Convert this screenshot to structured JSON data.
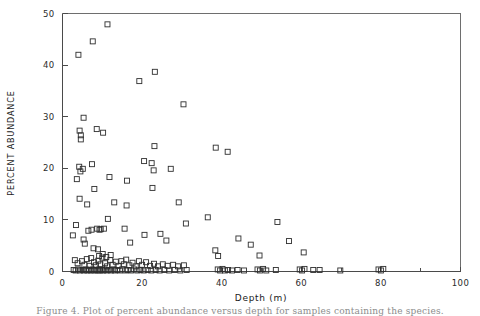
{
  "figure": {
    "caption": "Figure 4. Plot of percent abundance versus depth for samples containing the species."
  },
  "chart_data": {
    "type": "scatter",
    "title": "",
    "subtitle": "",
    "xlabel": "Depth (m)",
    "ylabel": "PERCENT ABUNDANCE",
    "xlim": [
      0,
      100
    ],
    "ylim": [
      0,
      50
    ],
    "xticks": [
      0,
      20,
      40,
      60,
      80,
      100
    ],
    "xtick_labels": [
      "0",
      "20",
      "40",
      "60",
      "80",
      "100"
    ],
    "xminor_ticks": [
      10,
      30,
      50,
      70,
      90
    ],
    "yticks": [
      0,
      10,
      20,
      30,
      40,
      50
    ],
    "ytick_labels": [
      "0",
      "10",
      "20",
      "30",
      "40",
      "50"
    ],
    "grid": false,
    "legend": null,
    "legend_position": "none",
    "marker": "open-square",
    "marker_color": "#2e2e2e",
    "marker_size": 5,
    "frame": "box",
    "series": [
      {
        "name": "percent abundance",
        "points": [
          [
            4.0,
            42.0
          ],
          [
            7.6,
            44.6
          ],
          [
            11.3,
            47.9
          ],
          [
            19.3,
            36.9
          ],
          [
            23.2,
            38.7
          ],
          [
            30.4,
            32.4
          ],
          [
            20.5,
            21.4
          ],
          [
            23.1,
            24.3
          ],
          [
            22.4,
            21.0
          ],
          [
            5.3,
            29.8
          ],
          [
            4.3,
            27.3
          ],
          [
            4.6,
            26.4
          ],
          [
            4.6,
            25.6
          ],
          [
            8.6,
            27.6
          ],
          [
            10.2,
            26.9
          ],
          [
            4.2,
            20.3
          ],
          [
            4.5,
            19.4
          ],
          [
            5.1,
            19.9
          ],
          [
            3.6,
            17.9
          ],
          [
            7.4,
            20.8
          ],
          [
            11.8,
            18.3
          ],
          [
            16.2,
            17.6
          ],
          [
            22.9,
            19.6
          ],
          [
            27.2,
            19.9
          ],
          [
            22.6,
            16.2
          ],
          [
            4.3,
            14.1
          ],
          [
            6.2,
            13.0
          ],
          [
            8.0,
            16.0
          ],
          [
            13.0,
            13.4
          ],
          [
            16.1,
            12.8
          ],
          [
            29.2,
            13.4
          ],
          [
            38.5,
            24.0
          ],
          [
            41.5,
            23.2
          ],
          [
            2.6,
            7.0
          ],
          [
            3.4,
            9.0
          ],
          [
            5.3,
            6.2
          ],
          [
            5.6,
            5.4
          ],
          [
            6.5,
            7.9
          ],
          [
            7.3,
            8.1
          ],
          [
            8.7,
            8.3
          ],
          [
            9.3,
            8.1
          ],
          [
            9.6,
            8.2
          ],
          [
            10.4,
            8.3
          ],
          [
            11.4,
            10.2
          ],
          [
            7.8,
            4.5
          ],
          [
            8.9,
            4.3
          ],
          [
            9.2,
            3.0
          ],
          [
            10.1,
            3.4
          ],
          [
            11.0,
            2.8
          ],
          [
            12.1,
            3.2
          ],
          [
            15.6,
            8.3
          ],
          [
            17.0,
            5.6
          ],
          [
            20.6,
            7.1
          ],
          [
            24.6,
            7.3
          ],
          [
            26.1,
            6.0
          ],
          [
            31.0,
            9.3
          ],
          [
            36.5,
            10.5
          ],
          [
            38.4,
            4.1
          ],
          [
            39.1,
            3.0
          ],
          [
            44.2,
            6.4
          ],
          [
            47.3,
            5.2
          ],
          [
            49.5,
            3.1
          ],
          [
            54.0,
            9.6
          ],
          [
            56.9,
            5.9
          ],
          [
            60.6,
            3.7
          ],
          [
            3.1,
            2.2
          ],
          [
            3.8,
            1.6
          ],
          [
            4.9,
            2.0
          ],
          [
            5.5,
            1.3
          ],
          [
            6.1,
            2.4
          ],
          [
            6.8,
            1.1
          ],
          [
            7.2,
            2.6
          ],
          [
            7.9,
            1.8
          ],
          [
            8.4,
            1.2
          ],
          [
            9.0,
            2.1
          ],
          [
            9.5,
            1.4
          ],
          [
            10.0,
            2.7
          ],
          [
            10.7,
            1.6
          ],
          [
            11.2,
            1.0
          ],
          [
            12.0,
            2.2
          ],
          [
            12.6,
            1.3
          ],
          [
            13.4,
            1.9
          ],
          [
            14.1,
            1.1
          ],
          [
            14.8,
            2.0
          ],
          [
            15.4,
            1.4
          ],
          [
            16.0,
            2.3
          ],
          [
            16.8,
            1.2
          ],
          [
            17.6,
            1.7
          ],
          [
            18.4,
            1.0
          ],
          [
            19.2,
            2.0
          ],
          [
            20.0,
            1.3
          ],
          [
            21.0,
            1.8
          ],
          [
            22.0,
            1.1
          ],
          [
            23.0,
            1.5
          ],
          [
            24.0,
            1.0
          ],
          [
            25.2,
            1.4
          ],
          [
            26.4,
            1.1
          ],
          [
            27.8,
            1.3
          ],
          [
            29.0,
            1.0
          ],
          [
            30.5,
            1.2
          ],
          [
            2.8,
            0.3
          ],
          [
            3.3,
            0.2
          ],
          [
            3.9,
            0.4
          ],
          [
            4.4,
            0.2
          ],
          [
            5.0,
            0.3
          ],
          [
            5.4,
            0.2
          ],
          [
            5.9,
            0.4
          ],
          [
            6.3,
            0.2
          ],
          [
            6.7,
            0.3
          ],
          [
            7.1,
            0.2
          ],
          [
            7.5,
            0.4
          ],
          [
            8.0,
            0.2
          ],
          [
            8.3,
            0.3
          ],
          [
            8.8,
            0.2
          ],
          [
            9.1,
            0.4
          ],
          [
            9.4,
            0.2
          ],
          [
            9.8,
            0.3
          ],
          [
            10.2,
            0.2
          ],
          [
            10.6,
            0.4
          ],
          [
            11.1,
            0.2
          ],
          [
            11.6,
            0.3
          ],
          [
            12.2,
            0.2
          ],
          [
            12.8,
            0.4
          ],
          [
            13.2,
            0.2
          ],
          [
            13.8,
            0.3
          ],
          [
            14.4,
            0.2
          ],
          [
            15.0,
            0.4
          ],
          [
            15.8,
            0.2
          ],
          [
            16.4,
            0.3
          ],
          [
            17.2,
            0.2
          ],
          [
            18.0,
            0.4
          ],
          [
            18.8,
            0.2
          ],
          [
            19.6,
            0.3
          ],
          [
            20.4,
            0.2
          ],
          [
            21.4,
            0.3
          ],
          [
            22.3,
            0.2
          ],
          [
            23.4,
            0.3
          ],
          [
            24.4,
            0.2
          ],
          [
            25.6,
            0.3
          ],
          [
            26.8,
            0.2
          ],
          [
            28.2,
            0.3
          ],
          [
            29.6,
            0.2
          ],
          [
            31.2,
            0.3
          ],
          [
            39.0,
            0.4
          ],
          [
            39.6,
            0.2
          ],
          [
            40.2,
            0.5
          ],
          [
            40.8,
            0.2
          ],
          [
            41.6,
            0.3
          ],
          [
            42.6,
            0.2
          ],
          [
            44.0,
            0.3
          ],
          [
            45.6,
            0.2
          ],
          [
            49.0,
            0.4
          ],
          [
            49.6,
            0.2
          ],
          [
            50.4,
            0.5
          ],
          [
            51.2,
            0.2
          ],
          [
            53.6,
            0.3
          ],
          [
            59.6,
            0.4
          ],
          [
            60.2,
            0.2
          ],
          [
            60.8,
            0.5
          ],
          [
            63.0,
            0.3
          ],
          [
            64.6,
            0.3
          ],
          [
            69.8,
            0.2
          ],
          [
            79.4,
            0.4
          ],
          [
            80.0,
            0.2
          ],
          [
            80.6,
            0.5
          ]
        ]
      }
    ]
  }
}
